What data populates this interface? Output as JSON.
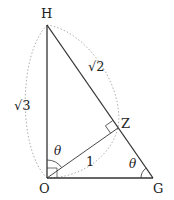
{
  "diagram": {
    "title": "",
    "points": {
      "H": {
        "label": "H",
        "x": 47,
        "y": 25
      },
      "O": {
        "label": "O",
        "x": 47,
        "y": 178
      },
      "G": {
        "label": "G",
        "x": 153,
        "y": 178
      },
      "Z": {
        "label": "Z",
        "x": 118,
        "y": 128
      }
    },
    "edge_labels": {
      "OH": "√3",
      "HZ": "√2",
      "OZ": "1"
    },
    "angle_labels": {
      "HOZ": "θ",
      "OGH": "θ"
    },
    "colors": {
      "line": "#333333",
      "dotted": "#999999",
      "text": "#222222"
    }
  }
}
